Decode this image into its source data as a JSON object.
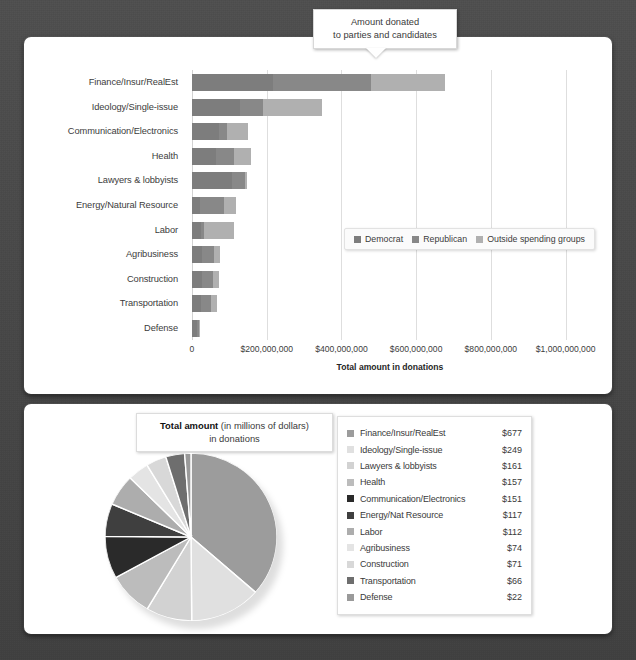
{
  "callout": {
    "line1": "Amount donated",
    "line2": "to parties and candidates"
  },
  "bar_chart": {
    "x_axis_title": "Total amount in donations",
    "x_ticks": [
      "0",
      "$200,000,000",
      "$400,000,000",
      "$600,000,000",
      "$800,000,000",
      "$1,000,000,000"
    ],
    "legend": [
      {
        "label": "Democrat",
        "color": "#7d7d7d"
      },
      {
        "label": "Republican",
        "color": "#888888"
      },
      {
        "label": "Outside spending groups",
        "color": "#b0b0b0"
      }
    ]
  },
  "pie_chart": {
    "title_bold": "Total amount",
    "title_rest": " (in millions of dollars)",
    "title_line2": "in donations"
  },
  "chart_data": [
    {
      "type": "bar",
      "orientation": "horizontal",
      "stacked": true,
      "title": "",
      "xlabel": "Total amount in donations",
      "ylabel": "",
      "xlim": [
        0,
        1060000000
      ],
      "xticks": [
        0,
        200000000,
        400000000,
        600000000,
        800000000,
        1000000000
      ],
      "xticklabels": [
        "0",
        "$200,000,000",
        "$400,000,000",
        "$600,000,000",
        "$800,000,000",
        "$1,000,000,000"
      ],
      "grid": true,
      "legend_position": "inside-right",
      "categories": [
        "Finance/Insur/RealEst",
        "Ideology/Single-issue",
        "Communication/Electronics",
        "Health",
        "Lawyers & lobbyists",
        "Energy/Natural Resource",
        "Labor",
        "Agribusiness",
        "Construction",
        "Transportation",
        "Defense"
      ],
      "series": [
        {
          "name": "Democrat",
          "color": "#7d7d7d",
          "values": [
            218000000,
            128000000,
            73000000,
            63000000,
            106000000,
            22000000,
            25000000,
            27000000,
            26000000,
            25000000,
            13000000
          ]
        },
        {
          "name": "Republican",
          "color": "#888888",
          "values": [
            262000000,
            61000000,
            22000000,
            49000000,
            36000000,
            64000000,
            8000000,
            31000000,
            29000000,
            26000000,
            5000000
          ]
        },
        {
          "name": "Outside spending groups",
          "color": "#b0b0b0",
          "values": [
            197000000,
            160000000,
            56000000,
            45000000,
            6000000,
            31000000,
            79000000,
            16000000,
            16000000,
            15000000,
            4000000
          ]
        }
      ],
      "totals": [
        677000000,
        349000000,
        151000000,
        157000000,
        148000000,
        117000000,
        112000000,
        74000000,
        71000000,
        66000000,
        22000000
      ]
    },
    {
      "type": "pie",
      "title": "Total amount (in millions of dollars) in donations",
      "units": "millions of dollars",
      "start_angle_deg": 0,
      "direction": "clockwise",
      "slices": [
        {
          "label": "Finance/Insur/RealEst",
          "value": 677,
          "display": "$677",
          "color": "#9c9c9c"
        },
        {
          "label": "Ideology/Single-issue",
          "value": 249,
          "display": "$249",
          "color": "#e0e0e0"
        },
        {
          "label": "Lawyers & lobbyists",
          "value": 161,
          "display": "$161",
          "color": "#d2d2d2"
        },
        {
          "label": "Health",
          "value": 157,
          "display": "$157",
          "color": "#bcbcbc"
        },
        {
          "label": "Communication/Electronics",
          "value": 151,
          "display": "$151",
          "color": "#2a2a2a"
        },
        {
          "label": "Energy/Nat Resource",
          "value": 117,
          "display": "$117",
          "color": "#3f3f3f"
        },
        {
          "label": "Labor",
          "value": 112,
          "display": "$112",
          "color": "#adadad"
        },
        {
          "label": "Agribusiness",
          "value": 74,
          "display": "$74",
          "color": "#e4e4e4"
        },
        {
          "label": "Construction",
          "value": 71,
          "display": "$71",
          "color": "#d8d8d8"
        },
        {
          "label": "Transportation",
          "value": 66,
          "display": "$66",
          "color": "#6e6e6e"
        },
        {
          "label": "Defense",
          "value": 22,
          "display": "$22",
          "color": "#9a9a9a"
        }
      ],
      "total": 1857
    }
  ]
}
